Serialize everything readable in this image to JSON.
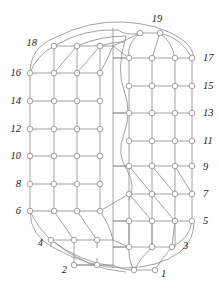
{
  "figure": {
    "type": "graph-diagram",
    "width": 219,
    "height": 288,
    "background_color": "#ffffff",
    "stroke_color": "#8a8a8a",
    "label_color": "#1a1a1a",
    "node_fill": "#ffffff",
    "node_radius": 2.8,
    "node_count": 76,
    "boundary_labels": {
      "left_column": [
        "18",
        "16",
        "14",
        "12",
        "10",
        "8",
        "6",
        "4",
        "2"
      ],
      "right_column": [
        "17",
        "15",
        "13",
        "11",
        "9",
        "7",
        "5",
        "3",
        "1"
      ],
      "top": [
        "19"
      ]
    },
    "labels": [
      {
        "text": "19",
        "x": 157,
        "y": 22,
        "anchor": "middle"
      },
      {
        "text": "18",
        "x": 37,
        "y": 46,
        "anchor": "end"
      },
      {
        "text": "17",
        "x": 203,
        "y": 61,
        "anchor": "start"
      },
      {
        "text": "16",
        "x": 21,
        "y": 76,
        "anchor": "end"
      },
      {
        "text": "15",
        "x": 203,
        "y": 89,
        "anchor": "start"
      },
      {
        "text": "14",
        "x": 21,
        "y": 104,
        "anchor": "end"
      },
      {
        "text": "13",
        "x": 203,
        "y": 116,
        "anchor": "start"
      },
      {
        "text": "12",
        "x": 21,
        "y": 132,
        "anchor": "end"
      },
      {
        "text": "11",
        "x": 203,
        "y": 144,
        "anchor": "start"
      },
      {
        "text": "10",
        "x": 21,
        "y": 159,
        "anchor": "end"
      },
      {
        "text": "9",
        "x": 203,
        "y": 170,
        "anchor": "start"
      },
      {
        "text": "8",
        "x": 21,
        "y": 187,
        "anchor": "end"
      },
      {
        "text": "7",
        "x": 203,
        "y": 197,
        "anchor": "start"
      },
      {
        "text": "6",
        "x": 21,
        "y": 214,
        "anchor": "end"
      },
      {
        "text": "5",
        "x": 203,
        "y": 224,
        "anchor": "start"
      },
      {
        "text": "4",
        "x": 43,
        "y": 246,
        "anchor": "end"
      },
      {
        "text": "3",
        "x": 183,
        "y": 249,
        "anchor": "start"
      },
      {
        "text": "2",
        "x": 67,
        "y": 273,
        "anchor": "end"
      },
      {
        "text": "1",
        "x": 161,
        "y": 277,
        "anchor": "start"
      }
    ],
    "nodes": [
      {
        "id": "L1C1",
        "x": 30,
        "y": 73
      },
      {
        "id": "L1C2",
        "x": 54,
        "y": 73
      },
      {
        "id": "L1C3",
        "x": 77,
        "y": 73
      },
      {
        "id": "L1C4",
        "x": 100,
        "y": 73
      },
      {
        "id": "L2C1",
        "x": 30,
        "y": 101
      },
      {
        "id": "L2C2",
        "x": 54,
        "y": 101
      },
      {
        "id": "L2C3",
        "x": 77,
        "y": 101
      },
      {
        "id": "L2C4",
        "x": 100,
        "y": 101
      },
      {
        "id": "L3C1",
        "x": 30,
        "y": 129
      },
      {
        "id": "L3C2",
        "x": 54,
        "y": 129
      },
      {
        "id": "L3C3",
        "x": 77,
        "y": 129
      },
      {
        "id": "L3C4",
        "x": 100,
        "y": 129
      },
      {
        "id": "L4C1",
        "x": 30,
        "y": 156
      },
      {
        "id": "L4C2",
        "x": 54,
        "y": 156
      },
      {
        "id": "L4C3",
        "x": 77,
        "y": 156
      },
      {
        "id": "L4C4",
        "x": 100,
        "y": 156
      },
      {
        "id": "L5C1",
        "x": 30,
        "y": 184
      },
      {
        "id": "L5C2",
        "x": 54,
        "y": 184
      },
      {
        "id": "L5C3",
        "x": 77,
        "y": 184
      },
      {
        "id": "L5C4",
        "x": 100,
        "y": 184
      },
      {
        "id": "L6C1",
        "x": 30,
        "y": 211
      },
      {
        "id": "L6C2",
        "x": 54,
        "y": 211
      },
      {
        "id": "L6C3",
        "x": 77,
        "y": 211
      },
      {
        "id": "L6C4",
        "x": 100,
        "y": 211
      },
      {
        "id": "L0C2",
        "x": 54,
        "y": 46
      },
      {
        "id": "L0C3",
        "x": 77,
        "y": 46
      },
      {
        "id": "L0C4",
        "x": 100,
        "y": 46
      },
      {
        "id": "L7C2",
        "x": 51,
        "y": 240
      },
      {
        "id": "L7C3",
        "x": 74,
        "y": 240
      },
      {
        "id": "L7C4",
        "x": 97,
        "y": 240
      },
      {
        "id": "L8C3",
        "x": 74,
        "y": 265
      },
      {
        "id": "L8C4",
        "x": 97,
        "y": 265
      },
      {
        "id": "R1C1",
        "x": 129,
        "y": 58
      },
      {
        "id": "R1C2",
        "x": 152,
        "y": 58
      },
      {
        "id": "R1C3",
        "x": 175,
        "y": 58
      },
      {
        "id": "R1C4",
        "x": 192,
        "y": 58
      },
      {
        "id": "R2C1",
        "x": 129,
        "y": 86
      },
      {
        "id": "R2C2",
        "x": 152,
        "y": 86
      },
      {
        "id": "R2C3",
        "x": 175,
        "y": 86
      },
      {
        "id": "R2C4",
        "x": 192,
        "y": 86
      },
      {
        "id": "R3C1",
        "x": 129,
        "y": 113
      },
      {
        "id": "R3C2",
        "x": 152,
        "y": 113
      },
      {
        "id": "R3C3",
        "x": 175,
        "y": 113
      },
      {
        "id": "R3C4",
        "x": 192,
        "y": 113
      },
      {
        "id": "R4C1",
        "x": 129,
        "y": 141
      },
      {
        "id": "R4C2",
        "x": 152,
        "y": 141
      },
      {
        "id": "R4C3",
        "x": 175,
        "y": 141
      },
      {
        "id": "R4C4",
        "x": 192,
        "y": 141
      },
      {
        "id": "R5C1",
        "x": 129,
        "y": 166
      },
      {
        "id": "R5C2",
        "x": 152,
        "y": 166
      },
      {
        "id": "R5C3",
        "x": 175,
        "y": 166
      },
      {
        "id": "R5C4",
        "x": 192,
        "y": 166
      },
      {
        "id": "R6C1",
        "x": 129,
        "y": 194
      },
      {
        "id": "R6C2",
        "x": 152,
        "y": 194
      },
      {
        "id": "R6C3",
        "x": 175,
        "y": 194
      },
      {
        "id": "R6C4",
        "x": 192,
        "y": 194
      },
      {
        "id": "R7C1",
        "x": 129,
        "y": 221
      },
      {
        "id": "R7C2",
        "x": 152,
        "y": 221
      },
      {
        "id": "R7C3",
        "x": 175,
        "y": 221
      },
      {
        "id": "R7C4",
        "x": 192,
        "y": 221
      },
      {
        "id": "R0C2",
        "x": 140,
        "y": 33
      },
      {
        "id": "R0C3",
        "x": 160,
        "y": 33
      },
      {
        "id": "R8C1",
        "x": 129,
        "y": 247
      },
      {
        "id": "R8C2",
        "x": 152,
        "y": 247
      },
      {
        "id": "R8C3",
        "x": 172,
        "y": 247
      },
      {
        "id": "R9C2",
        "x": 134,
        "y": 270
      },
      {
        "id": "R9C3",
        "x": 155,
        "y": 270
      }
    ]
  }
}
